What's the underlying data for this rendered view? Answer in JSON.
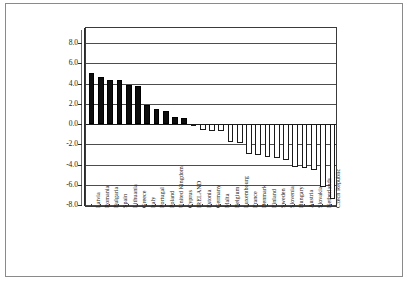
{
  "chart_data": {
    "type": "bar",
    "title": "",
    "subtitle": "",
    "xlabel": "",
    "ylabel": "",
    "ylim": [
      -8.0,
      9.0
    ],
    "grid": true,
    "legend": "none",
    "ytick_labels": [
      "8.0",
      "6.0",
      "4.0",
      "2.0",
      "0.0",
      "-2.0",
      "-4.0",
      "-6.0",
      "-8.0"
    ],
    "ytick_values": [
      8.0,
      6.0,
      4.0,
      2.0,
      0.0,
      -2.0,
      -4.0,
      -6.0,
      -8.0
    ],
    "categories": [
      "Latvia",
      "Romania",
      "Bulgaria",
      "Spain",
      "Lithuania",
      "Greece",
      "Italy",
      "Portugal",
      "Poland",
      "United Kingdom",
      "Cyprus",
      "IRELAND",
      "Estonia",
      "Germany",
      "Malta",
      "Belgium",
      "Luxembourg",
      "France",
      "Denmark",
      "Finland",
      "Sweden",
      "Slovenia",
      "Hungary",
      "Austria",
      "Slovakia",
      "Netherlands",
      "Czech Republic"
    ],
    "values": [
      5.0,
      4.7,
      4.4,
      4.4,
      3.9,
      3.8,
      1.9,
      1.5,
      1.3,
      0.7,
      0.6,
      -0.2,
      -0.6,
      -0.7,
      -0.7,
      -1.8,
      -1.9,
      -3.0,
      -3.1,
      -3.3,
      -3.4,
      -3.6,
      -4.2,
      -4.3,
      -4.5,
      -6.2,
      -7.4
    ],
    "highlight_category": "IRELAND",
    "positive_fill": "#0d0d0d",
    "negative_fill": "#ffffff",
    "bar_border": "#1a1a1a",
    "gridline_color": "#4d4d4d",
    "axis_color": "#2b2b2b"
  }
}
